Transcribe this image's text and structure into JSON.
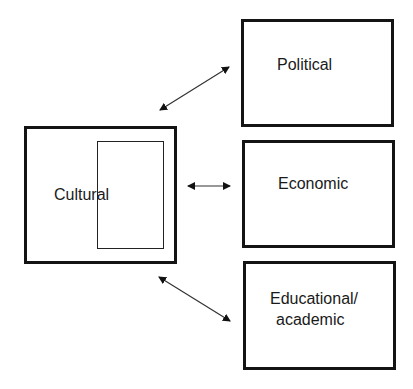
{
  "diagram": {
    "central": {
      "label": "Cultural"
    },
    "nodes": [
      {
        "id": "political",
        "label": "Political"
      },
      {
        "id": "economic",
        "label": "Economic"
      },
      {
        "id": "educational",
        "label_line1": "Educational/",
        "label_line2": "academic"
      }
    ],
    "edges": [
      {
        "from": "Cultural",
        "to": "Political",
        "type": "bidirectional"
      },
      {
        "from": "Cultural",
        "to": "Economic",
        "type": "bidirectional"
      },
      {
        "from": "Cultural",
        "to": "Educational/academic",
        "type": "bidirectional"
      }
    ]
  }
}
